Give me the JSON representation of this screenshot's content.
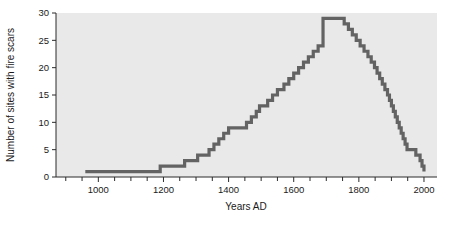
{
  "chart_data": {
    "type": "line",
    "subtype": "step",
    "title": "",
    "xlabel": "Years AD",
    "ylabel": "Number of sites with fire scars",
    "xlim": [
      870,
      2040
    ],
    "ylim": [
      0,
      30
    ],
    "grid": false,
    "legend": null,
    "x_major_ticks": [
      1000,
      1200,
      1400,
      1600,
      1800,
      2000
    ],
    "x_tick_labels": [
      "1000",
      "1200",
      "1400",
      "1600",
      "1800",
      "2000"
    ],
    "x_minor_tick_interval": 50,
    "y_major_ticks": [
      0,
      5,
      10,
      15,
      20,
      25,
      30
    ],
    "y_tick_labels": [
      "0",
      "5",
      "10",
      "15",
      "20",
      "25",
      "30"
    ],
    "series_name": "sites with fire scars",
    "line_color": "#636363",
    "plot_background": "#e9e9e9",
    "x": [
      960,
      1170,
      1190,
      1250,
      1265,
      1290,
      1305,
      1325,
      1340,
      1355,
      1370,
      1385,
      1400,
      1440,
      1455,
      1470,
      1485,
      1495,
      1505,
      1520,
      1535,
      1550,
      1570,
      1585,
      1600,
      1615,
      1630,
      1645,
      1660,
      1675,
      1690,
      1740,
      1755,
      1768,
      1780,
      1792,
      1804,
      1816,
      1828,
      1838,
      1848,
      1856,
      1864,
      1872,
      1880,
      1888,
      1894,
      1900,
      1906,
      1912,
      1918,
      1924,
      1930,
      1936,
      1942,
      1948,
      1960,
      1975,
      1988,
      1994,
      2000
    ],
    "y": [
      1,
      1,
      2,
      2,
      3,
      3,
      4,
      4,
      5,
      6,
      7,
      8,
      9,
      9,
      10,
      11,
      12,
      13,
      13,
      14,
      15,
      16,
      17,
      18,
      19,
      20,
      21,
      22,
      23,
      24,
      29,
      29,
      28,
      27,
      26,
      25,
      24,
      23,
      22,
      21,
      20,
      19,
      18,
      17,
      16,
      15,
      14,
      13,
      12,
      11,
      10,
      9,
      8,
      7,
      6,
      5,
      5,
      4,
      3,
      2,
      1
    ]
  },
  "axes": {
    "ylabel": "Number of sites with fire scars",
    "xlabel": "Years AD",
    "y_ticks": [
      "30",
      "25",
      "20",
      "15",
      "10",
      "5",
      "0"
    ],
    "x_ticks": [
      "1000",
      "1200",
      "1400",
      "1600",
      "1800",
      "2000"
    ]
  }
}
